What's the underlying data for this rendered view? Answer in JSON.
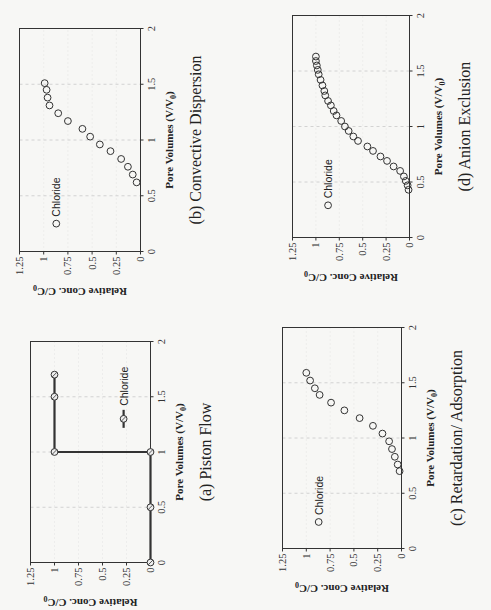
{
  "chart_data": [
    {
      "id": "a",
      "type": "line",
      "caption": "(a) Piston Flow",
      "xlabel": "Pore Volumes (V/V",
      "xlabel_sub": "0",
      "ylabel": "Relative Conc. C/C",
      "ylabel_sub": "0",
      "xlim": [
        0,
        2
      ],
      "ylim": [
        0,
        1.25
      ],
      "xticks": [
        "0",
        "0.5",
        "1",
        "1.5",
        "2"
      ],
      "yticks": [
        "0",
        "0.25",
        "0.5",
        "0.75",
        "1",
        "1.25"
      ],
      "grid": true,
      "legend": {
        "label": "Chloride",
        "style": "line-marker",
        "pos": [
          1.3,
          0.28
        ]
      },
      "series": [
        {
          "name": "Chloride",
          "marker": "circle-cross",
          "line": true,
          "x": [
            0,
            0.5,
            1,
            1,
            1.5,
            1.7
          ],
          "y": [
            0,
            0,
            0,
            1,
            1,
            1
          ]
        }
      ]
    },
    {
      "id": "b",
      "type": "scatter",
      "caption": "(b) Convective Dispersion",
      "xlabel": "Pore Volumes (V/V",
      "xlabel_sub": "0",
      "ylabel": "Relative Conc. C/C",
      "ylabel_sub": "0",
      "xlim": [
        0,
        2
      ],
      "ylim": [
        0,
        1.25
      ],
      "xticks": [
        "0",
        "0.5",
        "1",
        "1.5",
        "2"
      ],
      "yticks": [
        "0",
        "0.25",
        "0.5",
        "0.75",
        "1",
        "1.25"
      ],
      "grid": true,
      "legend": {
        "label": "Chloride",
        "style": "marker",
        "pos": [
          0.25,
          0.87
        ]
      },
      "series": [
        {
          "name": "Chloride",
          "marker": "circle",
          "line": false,
          "x": [
            0.62,
            0.69,
            0.76,
            0.83,
            0.9,
            0.96,
            1.03,
            1.1,
            1.17,
            1.24,
            1.31,
            1.38,
            1.45,
            1.51
          ],
          "y": [
            0.04,
            0.08,
            0.13,
            0.2,
            0.31,
            0.42,
            0.52,
            0.6,
            0.75,
            0.85,
            0.94,
            0.96,
            0.97,
            0.99
          ]
        }
      ]
    },
    {
      "id": "c",
      "type": "scatter",
      "caption": "(c) Retardation/ Adsorption",
      "xlabel": "Pore Volumes (V/V",
      "xlabel_sub": "0",
      "ylabel": "Relative Conc. C/C",
      "ylabel_sub": "0",
      "xlim": [
        0,
        2
      ],
      "ylim": [
        0,
        1.25
      ],
      "xticks": [
        "0",
        "0.5",
        "1",
        "1.5",
        "2"
      ],
      "yticks": [
        "0",
        "0.25",
        "0.5",
        "0.75",
        "1",
        "1.25"
      ],
      "grid": true,
      "legend": {
        "label": "Chloride",
        "style": "marker",
        "pos": [
          0.24,
          0.87
        ]
      },
      "series": [
        {
          "name": "Chloride",
          "marker": "circle",
          "line": false,
          "x": [
            0.7,
            0.76,
            0.83,
            0.9,
            0.97,
            1.04,
            1.11,
            1.18,
            1.25,
            1.32,
            1.39,
            1.45,
            1.52,
            1.59
          ],
          "y": [
            0.02,
            0.04,
            0.07,
            0.1,
            0.13,
            0.2,
            0.3,
            0.44,
            0.6,
            0.74,
            0.86,
            0.91,
            0.96,
            1.0
          ]
        }
      ]
    },
    {
      "id": "d",
      "type": "scatter",
      "caption": "(d) Anion Exclusion",
      "xlabel": "Pore Volumes (V/V",
      "xlabel_sub": "0",
      "ylabel": "Relative Conc. C/C",
      "ylabel_sub": "0",
      "xlim": [
        0,
        2
      ],
      "ylim": [
        0,
        1.25
      ],
      "xticks": [
        "0",
        "0.5",
        "1",
        "1.5",
        "2"
      ],
      "yticks": [
        "0",
        "0.25",
        "0.5",
        "0.75",
        "1",
        "1.25"
      ],
      "grid": true,
      "legend": {
        "label": "Chloride",
        "style": "marker",
        "pos": [
          0.29,
          0.87
        ]
      },
      "series": [
        {
          "name": "Chloride",
          "marker": "circle",
          "line": false,
          "x": [
            0.43,
            0.47,
            0.51,
            0.55,
            0.6,
            0.64,
            0.69,
            0.73,
            0.78,
            0.82,
            0.87,
            0.91,
            0.96,
            1.0,
            1.05,
            1.1,
            1.14,
            1.19,
            1.23,
            1.28,
            1.32,
            1.37,
            1.42,
            1.47,
            1.51,
            1.55,
            1.59,
            1.63
          ],
          "y": [
            0.01,
            0.02,
            0.04,
            0.06,
            0.1,
            0.17,
            0.24,
            0.31,
            0.39,
            0.45,
            0.55,
            0.6,
            0.65,
            0.69,
            0.73,
            0.78,
            0.81,
            0.84,
            0.87,
            0.9,
            0.91,
            0.93,
            0.95,
            0.97,
            0.98,
            0.99,
            1.0,
            1.0
          ]
        }
      ]
    }
  ],
  "layout_frames": {
    "a": {
      "left": 30,
      "right": 150,
      "top": 341,
      "bottom": 562
    },
    "b": {
      "left": 19,
      "right": 140,
      "top": 28,
      "bottom": 251
    },
    "c": {
      "left": 282,
      "right": 401,
      "top": 327,
      "bottom": 548
    },
    "d": {
      "left": 292,
      "right": 409,
      "top": 15,
      "bottom": 237
    }
  }
}
